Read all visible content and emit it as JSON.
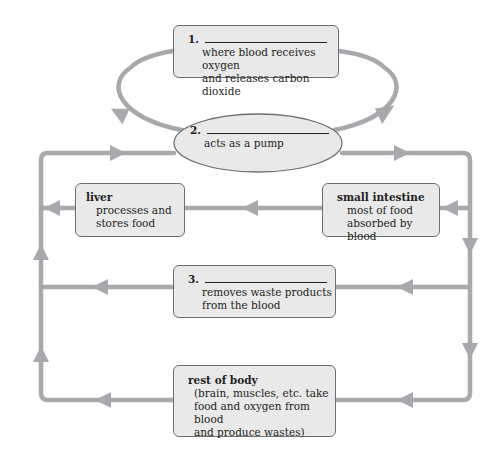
{
  "diagram": {
    "type": "circulatory-system-flow",
    "colors": {
      "arrow": "#a7a9ac",
      "box_fill": "#e9e9ea",
      "box_border": "#6d6e70",
      "text": "#231f20"
    },
    "organs": [
      {
        "id": "lungs",
        "number": "1.",
        "blank": true,
        "description": [
          "where blood receives oxygen",
          "and releases carbon dioxide"
        ]
      },
      {
        "id": "heart",
        "number": "2.",
        "blank": true,
        "description": [
          "acts as a pump"
        ]
      },
      {
        "id": "liver",
        "title": "liver",
        "description": [
          "processes and",
          "stores food"
        ]
      },
      {
        "id": "small_intestine",
        "title": "small intestine",
        "description": [
          "most of food",
          "absorbed by blood"
        ]
      },
      {
        "id": "kidneys",
        "number": "3.",
        "blank": true,
        "description": [
          "removes waste products",
          "from the blood"
        ]
      },
      {
        "id": "rest_of_body",
        "title": "rest of body",
        "description": [
          "(brain, muscles, etc. take",
          "food and oxygen from blood",
          "and produce wastes)"
        ]
      }
    ]
  }
}
